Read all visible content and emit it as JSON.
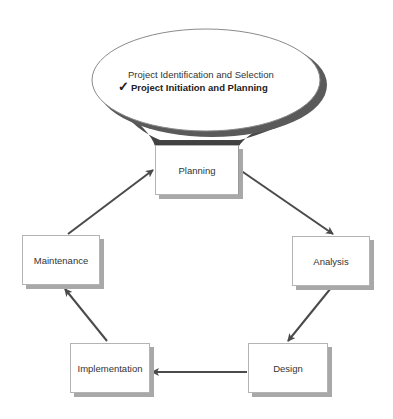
{
  "callout": {
    "items": [
      {
        "label": "Project Identification and Selection",
        "checked": false
      },
      {
        "label": "Project Initiation and Planning",
        "checked": true
      }
    ],
    "check_glyph": "✓"
  },
  "phases": {
    "planning": "Planning",
    "analysis": "Analysis",
    "design": "Design",
    "implementation": "Implementation",
    "maintenance": "Maintenance"
  },
  "flow": [
    {
      "from": "Planning",
      "to": "Analysis"
    },
    {
      "from": "Analysis",
      "to": "Design"
    },
    {
      "from": "Design",
      "to": "Implementation"
    },
    {
      "from": "Implementation",
      "to": "Maintenance"
    },
    {
      "from": "Maintenance",
      "to": "Planning"
    }
  ],
  "colors": {
    "arrow": "#4a4a4a",
    "box_border": "#b4b4b4",
    "box_shadow": "#a8a8a8",
    "ellipse_shadow": "#5a5a5a"
  }
}
